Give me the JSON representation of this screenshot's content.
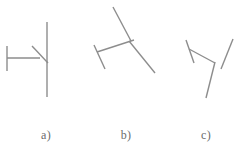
{
  "figure": {
    "background_color": "#ffffff",
    "stroke_color": "#8d8d8d",
    "stroke_width": 1.4,
    "width": 252,
    "height": 150,
    "captions": [
      {
        "id": "a",
        "label": "a)"
      },
      {
        "id": "b",
        "label": "b)"
      },
      {
        "id": "c",
        "label": "c)"
      }
    ],
    "panels": [
      {
        "id": "a",
        "strokes": [
          {
            "name": "left-end-tick",
            "x1": 7,
            "y1": 46,
            "x2": 7,
            "y2": 71
          },
          {
            "name": "horizontal-arm",
            "x1": 7,
            "y1": 58,
            "x2": 40,
            "y2": 58
          },
          {
            "name": "vertical-long-line",
            "x1": 47,
            "y1": 22,
            "x2": 47,
            "y2": 97
          },
          {
            "name": "diagonal-arm",
            "x1": 32,
            "y1": 46,
            "x2": 48,
            "y2": 63
          }
        ]
      },
      {
        "id": "b",
        "strokes": [
          {
            "name": "upper-left-diagonal",
            "x1": 113,
            "y1": 7,
            "x2": 131,
            "y2": 41
          },
          {
            "name": "left-end-tick",
            "x1": 94,
            "y1": 45,
            "x2": 105,
            "y2": 69
          },
          {
            "name": "left-arm",
            "x1": 97,
            "y1": 52,
            "x2": 134,
            "y2": 40
          },
          {
            "name": "right-arm",
            "x1": 129,
            "y1": 41,
            "x2": 155,
            "y2": 73
          }
        ]
      },
      {
        "id": "c",
        "strokes": [
          {
            "name": "left-end-tick",
            "x1": 186,
            "y1": 40,
            "x2": 194,
            "y2": 63
          },
          {
            "name": "upper-arm",
            "x1": 189,
            "y1": 49,
            "x2": 215,
            "y2": 63
          },
          {
            "name": "right-diagonal",
            "x1": 233,
            "y1": 39,
            "x2": 221,
            "y2": 69
          },
          {
            "name": "lower-arm",
            "x1": 215,
            "y1": 62,
            "x2": 206,
            "y2": 98
          }
        ]
      }
    ]
  }
}
